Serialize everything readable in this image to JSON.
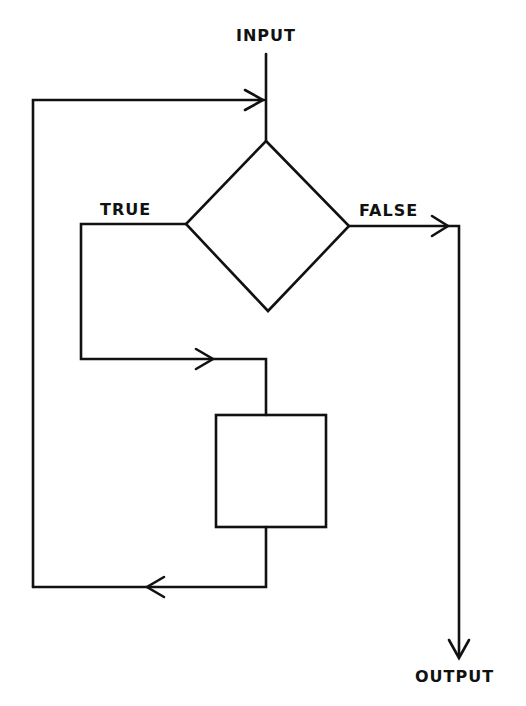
{
  "diagram": {
    "type": "flowchart-loop",
    "colors": {
      "stroke": "#111111",
      "background": "#ffffff"
    },
    "labels": {
      "input": "INPUT",
      "output": "OUTPUT",
      "true_branch": "TRUE",
      "false_branch": "FALSE"
    },
    "nodes": [
      {
        "id": "decision",
        "shape": "diamond",
        "label": ""
      },
      {
        "id": "process",
        "shape": "rectangle",
        "label": ""
      }
    ],
    "edges": [
      {
        "from": "input",
        "to": "decision"
      },
      {
        "from": "decision",
        "to": "process",
        "label": "TRUE"
      },
      {
        "from": "process",
        "to": "decision",
        "label": "loop back"
      },
      {
        "from": "decision",
        "to": "output",
        "label": "FALSE"
      }
    ]
  }
}
